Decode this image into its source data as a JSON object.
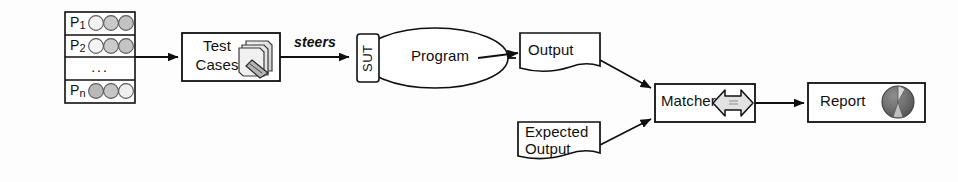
{
  "figure": {
    "background_color": "#fdfdfd",
    "stroke_color": "#101010"
  },
  "test_vector": {
    "label": "Test Vector",
    "rows": [
      {
        "name": "P",
        "subscript": "1",
        "circles": [
          "#f2f2f2",
          "#c9c9c9",
          "#c2c2c2"
        ]
      },
      {
        "name": "P",
        "subscript": "2",
        "circles": [
          "#f4f4f4",
          "#cccccc",
          "#c4c4c4"
        ]
      },
      {
        "name": "...",
        "subscript": "",
        "circles": []
      },
      {
        "name": "P",
        "subscript": "n",
        "circles": [
          "#b9b9b9",
          "#c6c6c6",
          "#efefef"
        ]
      }
    ],
    "ellipsis": "..."
  },
  "nodes": {
    "test_cases": {
      "label_line1": "Test",
      "label_line2": "Cases",
      "icon": "document-stack-icon"
    },
    "sut": {
      "label": "SUT"
    },
    "program": {
      "label": "Program"
    },
    "output": {
      "label": "Output"
    },
    "expected_output": {
      "label_line1": "Expected",
      "label_line2": "Output"
    },
    "matcher": {
      "label": "Matcher",
      "icon": "double-arrow-icon"
    },
    "report": {
      "label": "Report",
      "icon": "pie-chart-icon"
    }
  },
  "edges": {
    "steers": "steers"
  }
}
